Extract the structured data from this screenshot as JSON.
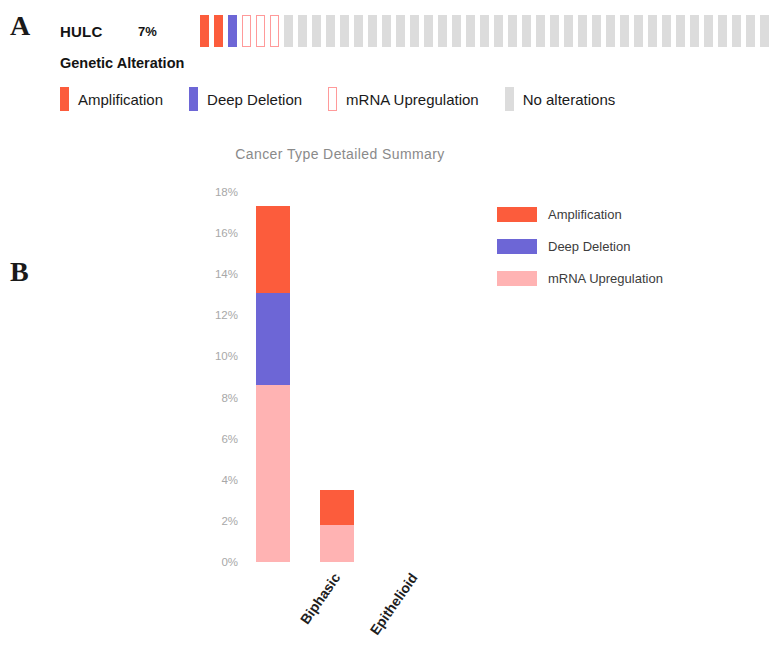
{
  "figure": {
    "panel_a_letter": "A",
    "panel_b_letter": "B"
  },
  "oncoprint": {
    "gene": "HULC",
    "percent": "7%",
    "legend_title": "Genetic Alteration",
    "cells": [
      "amp",
      "amp",
      "del",
      "mrna-up",
      "mrna-up",
      "mrna-up",
      "none",
      "none",
      "none",
      "none",
      "none",
      "none",
      "none",
      "none",
      "none",
      "none",
      "none",
      "none",
      "none",
      "none",
      "none",
      "none",
      "none",
      "none",
      "none",
      "none",
      "none",
      "none",
      "none",
      "none",
      "none",
      "none",
      "none",
      "none",
      "none",
      "none",
      "none",
      "none",
      "none",
      "none",
      "none"
    ],
    "legend": [
      {
        "key": "amp",
        "label": "Amplification",
        "color": "#fc5c3c"
      },
      {
        "key": "del",
        "label": "Deep Deletion",
        "color": "#6d66d6"
      },
      {
        "key": "mrna-up",
        "label": "mRNA Upregulation",
        "color": "#ff9a9a"
      },
      {
        "key": "none",
        "label": "No alterations",
        "color": "#dcdcdc"
      }
    ]
  },
  "chart_data": {
    "type": "bar",
    "title": "Cancer Type Detailed Summary",
    "xlabel": "",
    "ylabel": "Alteration Frequency",
    "categories": [
      "Biphasic",
      "Epithelioid"
    ],
    "ylim": [
      0,
      18
    ],
    "ytick_labels": [
      "0%",
      "2%",
      "4%",
      "6%",
      "8%",
      "10%",
      "12%",
      "14%",
      "16%",
      "18%"
    ],
    "ytick_values": [
      0,
      2,
      4,
      6,
      8,
      10,
      12,
      14,
      16,
      18
    ],
    "grid": false,
    "legend_position": "right",
    "stacked": true,
    "series": [
      {
        "name": "mRNA Upregulation",
        "color": "#ffb3b3",
        "values": [
          8.6,
          1.8
        ]
      },
      {
        "name": "Deep Deletion",
        "color": "#6d66d6",
        "values": [
          4.5,
          0
        ]
      },
      {
        "name": "Amplification",
        "color": "#fc5c3c",
        "values": [
          4.2,
          1.7
        ]
      }
    ],
    "totals": [
      17.3,
      3.5
    ],
    "legend_order": [
      "Amplification",
      "Deep Deletion",
      "mRNA Upregulation"
    ]
  }
}
